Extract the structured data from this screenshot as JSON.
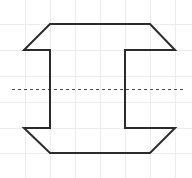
{
  "canvas": {
    "width": 192,
    "height": 178,
    "background_color": "#ffffff",
    "title": "Symmetric C-shaped polygon on grid"
  },
  "grid": {
    "visible": true,
    "color": "#ececec",
    "stroke_width": 1,
    "vertical_x": [
      25,
      50,
      75,
      100,
      125,
      150,
      175
    ],
    "horizontal_y": [
      24,
      50,
      76,
      102,
      128,
      153
    ],
    "cell_size": 25
  },
  "symmetry_axis": {
    "visible": true,
    "orientation": "horizontal",
    "y": 89,
    "x_start": 12,
    "x_end": 186,
    "color": "#4a4a4a",
    "stroke_width": 1,
    "dash_pattern": "3 3",
    "label": "axis-of-symmetry"
  },
  "shape": {
    "name": "c-shaped-chamfered-polygon",
    "stroke_color": "#2b2b2b",
    "stroke_width": 2,
    "fill": "none",
    "line_join": "miter",
    "vertices": [
      [
        50,
        24
      ],
      [
        150,
        24
      ],
      [
        175,
        50
      ],
      [
        125,
        50
      ],
      [
        125,
        128
      ],
      [
        175,
        128
      ],
      [
        150,
        153
      ],
      [
        50,
        153
      ],
      [
        24,
        128
      ],
      [
        50,
        128
      ],
      [
        50,
        50
      ],
      [
        24,
        50
      ]
    ],
    "closed": true,
    "vertex_count": 12,
    "edges": [
      {
        "name": "top-edge",
        "from": [
          50,
          24
        ],
        "to": [
          150,
          24
        ],
        "kind": "horizontal"
      },
      {
        "name": "top-right-chamfer",
        "from": [
          150,
          24
        ],
        "to": [
          175,
          50
        ],
        "kind": "diagonal"
      },
      {
        "name": "upper-right-inner-horizontal",
        "from": [
          175,
          50
        ],
        "to": [
          125,
          50
        ],
        "kind": "horizontal"
      },
      {
        "name": "right-inner-vertical",
        "from": [
          125,
          50
        ],
        "to": [
          125,
          128
        ],
        "kind": "vertical"
      },
      {
        "name": "lower-right-inner-horizontal",
        "from": [
          125,
          128
        ],
        "to": [
          175,
          128
        ],
        "kind": "horizontal"
      },
      {
        "name": "bottom-right-chamfer",
        "from": [
          175,
          128
        ],
        "to": [
          150,
          153
        ],
        "kind": "diagonal"
      },
      {
        "name": "bottom-edge",
        "from": [
          150,
          153
        ],
        "to": [
          50,
          153
        ],
        "kind": "horizontal"
      },
      {
        "name": "bottom-left-chamfer",
        "from": [
          50,
          153
        ],
        "to": [
          24,
          128
        ],
        "kind": "diagonal"
      },
      {
        "name": "lower-left-inner-horizontal",
        "from": [
          24,
          128
        ],
        "to": [
          50,
          128
        ],
        "kind": "horizontal"
      },
      {
        "name": "left-inner-vertical",
        "from": [
          50,
          128
        ],
        "to": [
          50,
          50
        ],
        "kind": "vertical"
      },
      {
        "name": "upper-left-inner-horizontal",
        "from": [
          50,
          50
        ],
        "to": [
          24,
          50
        ],
        "kind": "horizontal"
      },
      {
        "name": "left-outer-chamfer",
        "from": [
          24,
          50
        ],
        "to": [
          50,
          24
        ],
        "kind": "diagonal"
      }
    ]
  }
}
